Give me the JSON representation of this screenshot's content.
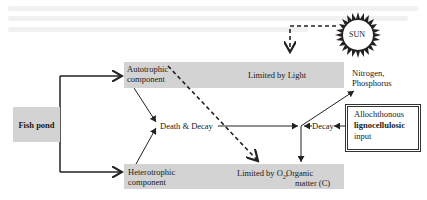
{
  "diagram": {
    "fish_pond": "Fish pond",
    "autotrophic": {
      "line1": "Autotrophic",
      "line2": "component"
    },
    "heterotrophic": {
      "line1": "Heterotrophic",
      "line2": "component"
    },
    "limited_light": "Limited by Light",
    "limited_o2": "Limited by O",
    "o2_sub": "2",
    "limited_o2_comma": ",",
    "organic": {
      "line1": "Organic",
      "line2": "matter (C)"
    },
    "nutrients": {
      "line1": "Nitrogen,",
      "line2": "Phosphorus"
    },
    "death_decay": "Death & Decay",
    "decay": "Decay",
    "sun": "SUN",
    "allochthonous": {
      "line1": "Allochthonous",
      "line2": "lignocellulosic",
      "line3": "input"
    }
  },
  "colors": {
    "band": "#d3d3d3",
    "line": "#222222"
  }
}
